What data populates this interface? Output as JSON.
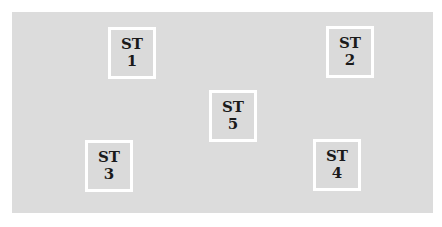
{
  "diagram": {
    "background_color": "#dcdcdc",
    "box_border_color": "#ffffff",
    "stations": [
      {
        "label": "ST",
        "number": "1",
        "x": 108,
        "y": 27
      },
      {
        "label": "ST",
        "number": "2",
        "x": 326,
        "y": 26
      },
      {
        "label": "ST",
        "number": "3",
        "x": 85,
        "y": 140
      },
      {
        "label": "ST",
        "number": "4",
        "x": 313,
        "y": 139
      },
      {
        "label": "ST",
        "number": "5",
        "x": 209,
        "y": 90
      }
    ]
  }
}
